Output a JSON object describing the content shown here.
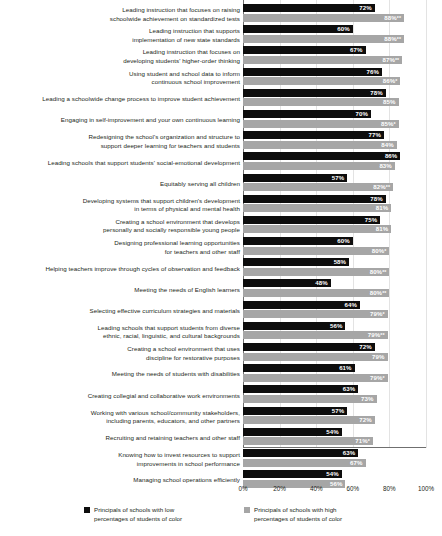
{
  "chart_data": {
    "type": "bar",
    "orientation": "horizontal",
    "title": "",
    "subtitle": "",
    "xlabel": "",
    "ylabel": "",
    "xlim": [
      0,
      100
    ],
    "xticks": [
      "0%",
      "20%",
      "40%",
      "60%",
      "80%",
      "100%"
    ],
    "xtick_values": [
      0,
      20,
      40,
      60,
      80,
      100
    ],
    "grid": true,
    "grid_axis": "x",
    "legend_position": "bottom",
    "series": [
      {
        "name": "Principals of schools with low\npercentages of students of color",
        "key": "low",
        "color": "#0d0d0d",
        "values": [
          72,
          60,
          67,
          76,
          78,
          70,
          77,
          86,
          57,
          78,
          75,
          60,
          58,
          48,
          64,
          56,
          72,
          61,
          63,
          57,
          54,
          63,
          54
        ]
      },
      {
        "name": "Principals of schools with high\npercentages of students of color",
        "key": "high",
        "color": "#a6a6a6",
        "values": [
          88,
          88,
          87,
          86,
          85,
          85,
          84,
          83,
          82,
          81,
          81,
          80,
          80,
          80,
          79,
          79,
          79,
          79,
          73,
          72,
          71,
          67,
          56
        ]
      }
    ],
    "categories": [
      "Leading instruction that focuses on raising\nschoolwide achievement on standardized tests",
      "Leading instruction that supports\nimplementation of new state standards",
      "Leading instruction that focuses on\ndeveloping students' higher-order thinking",
      "Using student and school data to inform\ncontinuous school improvement",
      "Leading a schoolwide change process to improve student achievement",
      "Engaging in self-improvement and your own continuous learning",
      "Redesigning the school's organization and structure to\nsupport deeper learning for teachers and students",
      "Leading schools that support students' social-emotional development",
      "Equitably serving all children",
      "Developing systems that support children's development\nin terms of physical and mental health",
      "Creating a school environment that develops\npersonally and socially responsible young people",
      "Designing professional learning opportunities\nfor teachers and other staff",
      "Helping teachers improve through cycles of observation and feedback",
      "Meeting the needs of English learners",
      "Selecting effective curriculum strategies and materials",
      "Leading schools that support students from diverse\nethnic, racial, linguistic, and cultural backgrounds",
      "Creating a school environment that uses\ndiscipline for restorative purposes",
      "Meeting the needs of students with disabilities",
      "Creating collegial and collaborative work environments",
      "Working with various school/community stakeholders,\nincluding parents, educators, and other partners",
      "Recruiting and retaining teachers and other staff",
      "Knowing how to invest resources to support\nimprovements in school performance",
      "Managing school operations efficiently"
    ],
    "rows": [
      {
        "label": "Leading instruction that focuses on raising\nschoolwide achievement on standardized tests",
        "label_lines": 2,
        "low": 72,
        "high": 88,
        "low_label": "72%",
        "high_label": "88%",
        "low_sig": "",
        "high_sig": "**"
      },
      {
        "label": "Leading instruction that supports\nimplementation of new state standards",
        "label_lines": 2,
        "low": 60,
        "high": 88,
        "low_label": "60%",
        "high_label": "88%",
        "low_sig": "",
        "high_sig": "**"
      },
      {
        "label": "Leading instruction that focuses on\ndeveloping students' higher-order thinking",
        "label_lines": 2,
        "low": 67,
        "high": 87,
        "low_label": "67%",
        "high_label": "87%",
        "low_sig": "",
        "high_sig": "**"
      },
      {
        "label": "Using student and school data to inform\ncontinuous school improvement",
        "label_lines": 2,
        "low": 76,
        "high": 86,
        "low_label": "76%",
        "high_label": "86%",
        "low_sig": "",
        "high_sig": "*"
      },
      {
        "label": "Leading a schoolwide change process to improve student achievement",
        "label_lines": 1,
        "low": 78,
        "high": 85,
        "low_label": "78%",
        "high_label": "85%",
        "low_sig": "",
        "high_sig": ""
      },
      {
        "label": "Engaging in self-improvement and your own continuous learning",
        "label_lines": 1,
        "low": 70,
        "high": 85,
        "low_label": "70%",
        "high_label": "85%",
        "low_sig": "",
        "high_sig": "*"
      },
      {
        "label": "Redesigning the school's organization and structure to\nsupport deeper learning for teachers and students",
        "label_lines": 2,
        "low": 77,
        "high": 84,
        "low_label": "77%",
        "high_label": "84%",
        "low_sig": "",
        "high_sig": ""
      },
      {
        "label": "Leading schools that support students' social-emotional development",
        "label_lines": 1,
        "low": 86,
        "high": 83,
        "low_label": "86%",
        "high_label": "83%",
        "low_sig": "",
        "high_sig": ""
      },
      {
        "label": "Equitably serving all children",
        "label_lines": 1,
        "low": 57,
        "high": 82,
        "low_label": "57%",
        "high_label": "82%",
        "low_sig": "",
        "high_sig": "**"
      },
      {
        "label": "Developing systems that support children's development\nin terms of physical and mental health",
        "label_lines": 2,
        "low": 78,
        "high": 81,
        "low_label": "78%",
        "high_label": "81%",
        "low_sig": "",
        "high_sig": ""
      },
      {
        "label": "Creating a school environment that develops\npersonally and socially responsible young people",
        "label_lines": 2,
        "low": 75,
        "high": 81,
        "low_label": "75%",
        "high_label": "81%",
        "low_sig": "",
        "high_sig": ""
      },
      {
        "label": "Designing professional learning opportunities\nfor teachers and other staff",
        "label_lines": 2,
        "low": 60,
        "high": 80,
        "low_label": "60%",
        "high_label": "80%",
        "low_sig": "",
        "high_sig": "*"
      },
      {
        "label": "Helping teachers improve through cycles of observation and feedback",
        "label_lines": 1,
        "low": 58,
        "high": 80,
        "low_label": "58%",
        "high_label": "80%",
        "low_sig": "",
        "high_sig": "**"
      },
      {
        "label": "Meeting the needs of English learners",
        "label_lines": 1,
        "low": 48,
        "high": 80,
        "low_label": "48%",
        "high_label": "80%",
        "low_sig": "",
        "high_sig": "**"
      },
      {
        "label": "Selecting effective curriculum strategies and materials",
        "label_lines": 1,
        "low": 64,
        "high": 79,
        "low_label": "64%",
        "high_label": "79%",
        "low_sig": "",
        "high_sig": "*"
      },
      {
        "label": "Leading schools that support students from diverse\nethnic, racial, linguistic, and cultural backgrounds",
        "label_lines": 2,
        "low": 56,
        "high": 79,
        "low_label": "56%",
        "high_label": "79%",
        "low_sig": "",
        "high_sig": "**"
      },
      {
        "label": "Creating a school environment that uses\ndiscipline for restorative purposes",
        "label_lines": 2,
        "low": 72,
        "high": 79,
        "low_label": "72%",
        "high_label": "79%",
        "low_sig": "",
        "high_sig": ""
      },
      {
        "label": "Meeting the needs of students with disabilities",
        "label_lines": 1,
        "low": 61,
        "high": 79,
        "low_label": "61%",
        "high_label": "79%",
        "low_sig": "",
        "high_sig": "*"
      },
      {
        "label": "Creating collegial and collaborative work environments",
        "label_lines": 1,
        "low": 63,
        "high": 73,
        "low_label": "63%",
        "high_label": "73%",
        "low_sig": "",
        "high_sig": ""
      },
      {
        "label": "Working with various school/community stakeholders,\nincluding parents, educators, and other partners",
        "label_lines": 2,
        "low": 57,
        "high": 72,
        "low_label": "57%",
        "high_label": "72%",
        "low_sig": "",
        "high_sig": ""
      },
      {
        "label": "Recruiting and retaining teachers and other staff",
        "label_lines": 1,
        "low": 54,
        "high": 71,
        "low_label": "54%",
        "high_label": "71%",
        "low_sig": "",
        "high_sig": "*"
      },
      {
        "label": "Knowing how to invest resources to support\nimprovements in school performance",
        "label_lines": 2,
        "low": 63,
        "high": 67,
        "low_label": "63%",
        "high_label": "67%",
        "low_sig": "",
        "high_sig": ""
      },
      {
        "label": "Managing school operations efficiently",
        "label_lines": 1,
        "low": 54,
        "high": 56,
        "low_label": "54%",
        "high_label": "56%",
        "low_sig": "",
        "high_sig": ""
      }
    ]
  },
  "legend": {
    "items": [
      {
        "label": "Principals of schools with low\npercentages of students of color",
        "color": "#0d0d0d",
        "key": "low"
      },
      {
        "label": "Principals of schools with high\npercentages of students of color",
        "color": "#a6a6a6",
        "key": "high"
      }
    ]
  },
  "axis": {
    "ticks": [
      "0%",
      "20%",
      "40%",
      "60%",
      "80%",
      "100%"
    ]
  }
}
